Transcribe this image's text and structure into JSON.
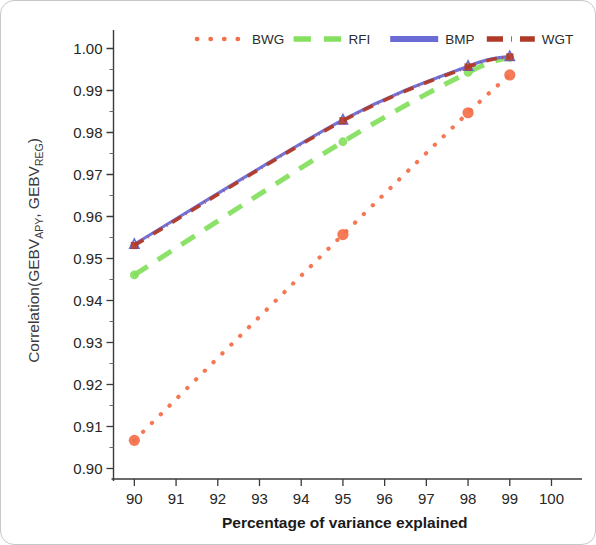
{
  "figure": {
    "background": "#ffffff",
    "border_color": "#c8c8c8"
  },
  "axis": {
    "x_title": "Percentage of variance explained",
    "y_title_main": "Correlation(GEBV",
    "y_title_sub1": "APY",
    "y_title_mid": ", GEBV",
    "y_title_sub2": "REG",
    "y_title_end": ")",
    "x_ticks": [
      "90",
      "91",
      "92",
      "93",
      "94",
      "95",
      "96",
      "97",
      "98",
      "99",
      "100"
    ],
    "y_ticks": [
      "0.90",
      "0.91",
      "0.92",
      "0.93",
      "0.94",
      "0.95",
      "0.96",
      "0.97",
      "0.98",
      "0.99",
      "1.00"
    ]
  },
  "legend": {
    "items": [
      {
        "label": "BWG",
        "color": "#f4704a",
        "style": "dotted"
      },
      {
        "label": "RFI",
        "color": "#86e060",
        "style": "dashed"
      },
      {
        "label": "BMP",
        "color": "#6b6bd6",
        "style": "solid"
      },
      {
        "label": "WGT",
        "color": "#b03a28",
        "style": "dashdot"
      }
    ]
  },
  "chart_data": {
    "type": "line",
    "title": "",
    "xlabel": "Percentage of variance explained",
    "ylabel": "Correlation(GEBV_APY, GEBV_REG)",
    "xlim": [
      89.5,
      100.3
    ],
    "ylim": [
      0.8975,
      1.0025
    ],
    "xticks": [
      90,
      91,
      92,
      93,
      94,
      95,
      96,
      97,
      98,
      99,
      100
    ],
    "yticks": [
      0.9,
      0.91,
      0.92,
      0.93,
      0.94,
      0.95,
      0.96,
      0.97,
      0.98,
      0.99,
      1.0
    ],
    "grid": false,
    "legend_position": "top",
    "x": [
      90,
      95,
      98,
      99
    ],
    "series": [
      {
        "name": "BWG",
        "color": "#f4704a",
        "style": "dotted",
        "marker": "circle",
        "values": [
          0.9067,
          0.9557,
          0.9847,
          0.9937
        ]
      },
      {
        "name": "RFI",
        "color": "#86e060",
        "style": "dashed",
        "marker": "circle",
        "values": [
          0.9461,
          0.9778,
          0.9943,
          0.9979
        ]
      },
      {
        "name": "BMP",
        "color": "#6b6bd6",
        "style": "solid",
        "marker": "triangle",
        "values": [
          0.9534,
          0.983,
          0.9958,
          0.9981
        ]
      },
      {
        "name": "WGT",
        "color": "#b03a28",
        "style": "dashdot",
        "marker": "square",
        "values": [
          0.9531,
          0.9828,
          0.9956,
          0.998
        ]
      }
    ]
  }
}
